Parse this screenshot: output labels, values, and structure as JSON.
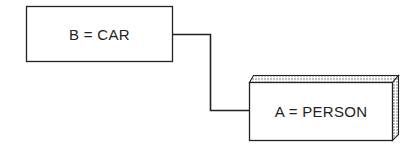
{
  "diagram": {
    "nodes": [
      {
        "id": "B",
        "label": "B = CAR",
        "style": "flat"
      },
      {
        "id": "A",
        "label": "A = PERSON",
        "style": "3d-shaded"
      }
    ],
    "edges": [
      {
        "from": "B",
        "to": "A",
        "type": "orthogonal-line"
      }
    ]
  },
  "colors": {
    "stroke": "#222222",
    "background": "#ffffff",
    "shade": "#bdbdbd"
  }
}
